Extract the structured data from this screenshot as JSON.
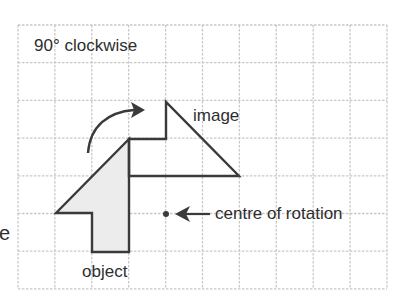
{
  "title": "90° clockwise",
  "labels": {
    "image": "image",
    "object": "object",
    "centre": "centre of rotation",
    "cropped_left": "e"
  },
  "grid": {
    "x0": 18,
    "y0": 25,
    "cols": 10,
    "rows": 7,
    "cell_w": 36.9,
    "cell_h": 37.7,
    "line_color": "#c8c8c8",
    "line_style": "dashed"
  },
  "shapes": {
    "object": {
      "points": [
        [
          129,
          139
        ],
        [
          56,
          213
        ],
        [
          92,
          213
        ],
        [
          92,
          252
        ],
        [
          129,
          252
        ]
      ],
      "fill": "#ececec",
      "stroke": "#3a3a3a"
    },
    "image": {
      "points": [
        [
          129,
          176
        ],
        [
          239,
          176
        ],
        [
          166,
          102
        ],
        [
          166,
          139
        ],
        [
          129,
          139
        ]
      ],
      "fill": "none",
      "stroke": "#3a3a3a"
    },
    "centre_point": [
      166,
      214
    ],
    "rotation_arrow": "curved arrow indicating clockwise rotation"
  },
  "colors": {
    "shape_stroke": "#3a3a3a",
    "object_fill": "#ececec",
    "grid": "#c8c8c8",
    "text": "#2e2e2e"
  }
}
